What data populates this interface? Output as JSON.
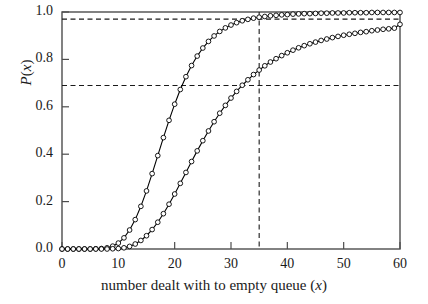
{
  "chart_data": {
    "type": "line",
    "title": "",
    "xlabel": "number dealt with to empty queue (x)",
    "ylabel": "P(x)",
    "xlim": [
      0,
      60
    ],
    "ylim": [
      0.0,
      1.0
    ],
    "grid": false,
    "legend": "none",
    "marker": "open-circle",
    "xticks": [
      0,
      10,
      20,
      30,
      40,
      50,
      60
    ],
    "xtick_labels": [
      "0",
      "10",
      "20",
      "30",
      "40",
      "50",
      "60"
    ],
    "yticks": [
      0.0,
      0.2,
      0.4,
      0.6,
      0.8,
      1.0
    ],
    "ytick_labels": [
      "0.0",
      "0.2",
      "0.4",
      "0.6",
      "0.8",
      "1.0"
    ],
    "annotations": [
      {
        "name": "upper-horizontal-reference",
        "type": "hline",
        "y": 0.97,
        "style": "dashed"
      },
      {
        "name": "lower-horizontal-reference",
        "type": "hline",
        "y": 0.69,
        "style": "dashed"
      },
      {
        "name": "vertical-reference",
        "type": "vline",
        "x": 35,
        "style": "dashed"
      }
    ],
    "x": [
      0,
      1,
      2,
      3,
      4,
      5,
      6,
      7,
      8,
      9,
      10,
      11,
      12,
      13,
      14,
      15,
      16,
      17,
      18,
      19,
      20,
      21,
      22,
      23,
      24,
      25,
      26,
      27,
      28,
      29,
      30,
      31,
      32,
      33,
      34,
      35,
      36,
      37,
      38,
      39,
      40,
      41,
      42,
      43,
      44,
      45,
      46,
      47,
      48,
      49,
      50,
      51,
      52,
      53,
      54,
      55,
      56,
      57,
      58,
      59,
      60
    ],
    "series": [
      {
        "name": "curve-left",
        "color": "#000000",
        "values": [
          0.0,
          0.0,
          0.0,
          0.0,
          0.0,
          0.0,
          0.001,
          0.002,
          0.005,
          0.012,
          0.025,
          0.047,
          0.08,
          0.124,
          0.18,
          0.245,
          0.318,
          0.394,
          0.47,
          0.543,
          0.611,
          0.673,
          0.727,
          0.774,
          0.814,
          0.848,
          0.876,
          0.899,
          0.918,
          0.933,
          0.945,
          0.955,
          0.963,
          0.969,
          0.974,
          0.978,
          0.981,
          0.984,
          0.986,
          0.988,
          0.989,
          0.991,
          0.992,
          0.993,
          0.993,
          0.994,
          0.995,
          0.995,
          0.996,
          0.996,
          0.996,
          0.997,
          0.997,
          0.997,
          0.997,
          0.998,
          0.998,
          0.998,
          0.998,
          0.998,
          0.998
        ]
      },
      {
        "name": "curve-right",
        "color": "#000000",
        "values": [
          0.0,
          0.0,
          0.0,
          0.0,
          0.0,
          0.0,
          0.0,
          0.0,
          0.0,
          0.001,
          0.002,
          0.005,
          0.011,
          0.021,
          0.036,
          0.056,
          0.082,
          0.113,
          0.149,
          0.189,
          0.232,
          0.277,
          0.323,
          0.369,
          0.414,
          0.457,
          0.498,
          0.537,
          0.573,
          0.606,
          0.637,
          0.665,
          0.691,
          0.714,
          0.736,
          0.755,
          0.773,
          0.789,
          0.803,
          0.816,
          0.828,
          0.839,
          0.849,
          0.858,
          0.866,
          0.873,
          0.88,
          0.886,
          0.892,
          0.897,
          0.902,
          0.906,
          0.91,
          0.914,
          0.917,
          0.921,
          0.924,
          0.927,
          0.929,
          0.932,
          0.948
        ]
      }
    ]
  },
  "axis": {
    "y_label_text": "P(x)",
    "x_label_text": "number dealt with to empty queue (x)"
  }
}
